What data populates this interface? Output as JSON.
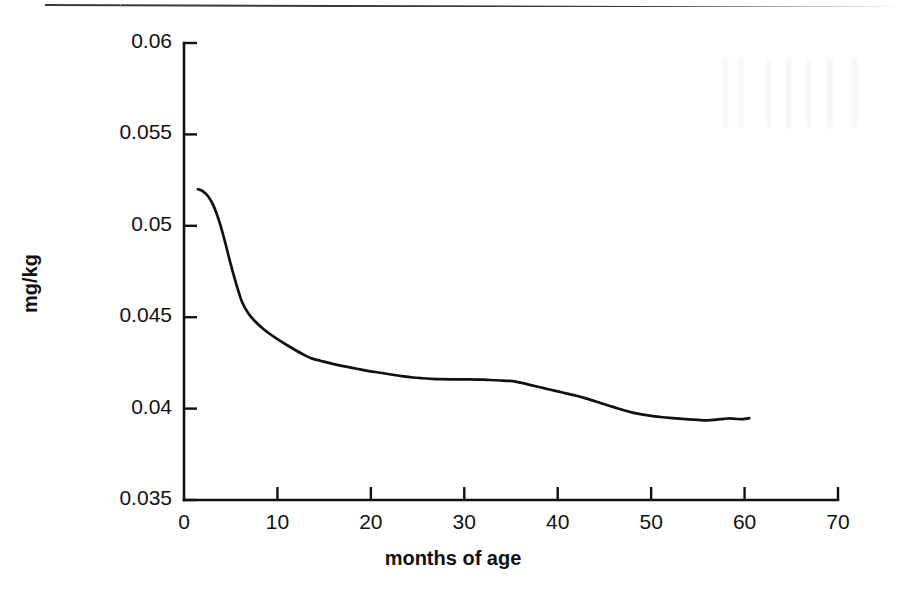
{
  "page": {
    "rule_present": true,
    "background": "#ffffff",
    "ink": "#111111"
  },
  "chart_data": {
    "type": "line",
    "title": "",
    "xlabel": "months of age",
    "ylabel": "mg/kg",
    "xlim": [
      0,
      70
    ],
    "ylim": [
      0.035,
      0.06
    ],
    "grid": false,
    "legend": null,
    "x_ticks": [
      0,
      10,
      20,
      30,
      40,
      50,
      60,
      70
    ],
    "x_tick_labels": [
      "0",
      "10",
      "20",
      "30",
      "40",
      "50",
      "60",
      "70"
    ],
    "y_ticks": [
      0.035,
      0.04,
      0.045,
      0.05,
      0.055,
      0.06
    ],
    "y_tick_labels": [
      "0.035",
      "0.04",
      "0.045",
      "0.05",
      "0.055",
      "0.06"
    ],
    "series": [
      {
        "name": "mg/kg",
        "color": "#111111",
        "x": [
          1.5,
          2.0,
          2.6,
          3.2,
          3.8,
          4.4,
          5.0,
          5.6,
          6.2,
          6.9,
          7.6,
          8.4,
          9.2,
          10.0,
          11.0,
          12.0,
          13.0,
          13.8,
          14.6,
          15.5,
          16.5,
          17.5,
          18.5,
          19.5,
          20.5,
          21.5,
          22.5,
          23.5,
          24.5,
          25.5,
          26.5,
          27.5,
          28.5,
          29.5,
          30.5,
          31.5,
          32.5,
          33.5,
          34.5,
          35.2,
          36.0,
          37.0,
          38.0,
          39.0,
          40.0,
          41.0,
          42.0,
          43.0,
          44.0,
          45.0,
          46.0,
          47.0,
          48.0,
          49.0,
          50.0,
          51.0,
          52.0,
          53.0,
          54.0,
          55.0,
          56.0,
          57.0,
          57.8,
          58.4,
          59.0,
          59.8,
          60.5
        ],
        "y": [
          0.052,
          0.0519,
          0.0516,
          0.05105,
          0.0502,
          0.0491,
          0.0479,
          0.0468,
          0.04585,
          0.0452,
          0.04478,
          0.0444,
          0.04408,
          0.0438,
          0.04348,
          0.04318,
          0.0429,
          0.04272,
          0.04262,
          0.0425,
          0.04238,
          0.04228,
          0.04218,
          0.04208,
          0.042,
          0.04192,
          0.04184,
          0.04176,
          0.0417,
          0.04166,
          0.04163,
          0.04161,
          0.0416,
          0.0416,
          0.0416,
          0.04159,
          0.04157,
          0.04155,
          0.04152,
          0.0415,
          0.04142,
          0.0413,
          0.04118,
          0.04106,
          0.04094,
          0.04082,
          0.0407,
          0.04056,
          0.0404,
          0.04024,
          0.04008,
          0.03992,
          0.03978,
          0.03968,
          0.0396,
          0.03954,
          0.03949,
          0.03945,
          0.03941,
          0.03938,
          0.03936,
          0.0394,
          0.03944,
          0.03946,
          0.03944,
          0.03942,
          0.03948
        ]
      }
    ],
    "annotations": []
  }
}
